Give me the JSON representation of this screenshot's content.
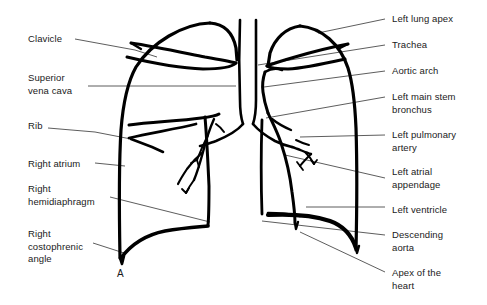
{
  "figure": {
    "type": "anatomical-line-diagram",
    "panel_marker": "A",
    "colors": {
      "background": "#ffffff",
      "ink": "#000000",
      "leader_line": "#333333",
      "text": "#1a1a1a"
    }
  },
  "labels_left": [
    {
      "id": "clavicle",
      "text": "Clavicle",
      "x": 28,
      "y": 33,
      "lines": 1
    },
    {
      "id": "superior-vena-cava",
      "text": "Superior\nvena cava",
      "x": 28,
      "y": 72,
      "lines": 2
    },
    {
      "id": "rib",
      "text": "Rib",
      "x": 28,
      "y": 120,
      "lines": 1
    },
    {
      "id": "right-atrium",
      "text": "Right atrium",
      "x": 28,
      "y": 158,
      "lines": 1
    },
    {
      "id": "right-hemidiaphragm",
      "text": "Right\nhemidiaphragm",
      "x": 28,
      "y": 183,
      "lines": 2
    },
    {
      "id": "right-costophrenic-angle",
      "text": "Right\ncostophrenic\nangle",
      "x": 28,
      "y": 228,
      "lines": 3
    }
  ],
  "labels_right": [
    {
      "id": "left-lung-apex",
      "text": "Left lung apex",
      "x": 392,
      "y": 13,
      "lines": 1
    },
    {
      "id": "trachea",
      "text": "Trachea",
      "x": 392,
      "y": 39,
      "lines": 1
    },
    {
      "id": "aortic-arch",
      "text": "Aortic arch",
      "x": 392,
      "y": 65,
      "lines": 1
    },
    {
      "id": "left-main-stem-bronchus",
      "text": "Left main stem\nbronchus",
      "x": 392,
      "y": 91,
      "lines": 2
    },
    {
      "id": "left-pulmonary-artery",
      "text": "Left pulmonary\nartery",
      "x": 392,
      "y": 129,
      "lines": 2
    },
    {
      "id": "left-atrial-appendage",
      "text": "Left atrial\nappendage",
      "x": 392,
      "y": 166,
      "lines": 2
    },
    {
      "id": "left-ventricle",
      "text": "Left ventricle",
      "x": 392,
      "y": 204,
      "lines": 1
    },
    {
      "id": "descending-aorta",
      "text": "Descending\naorta",
      "x": 392,
      "y": 229,
      "lines": 2
    },
    {
      "id": "apex-of-the-heart",
      "text": "Apex of the\nheart",
      "x": 392,
      "y": 267,
      "lines": 2
    }
  ],
  "panel_marker": {
    "text": "A",
    "x": 117,
    "y": 268
  }
}
